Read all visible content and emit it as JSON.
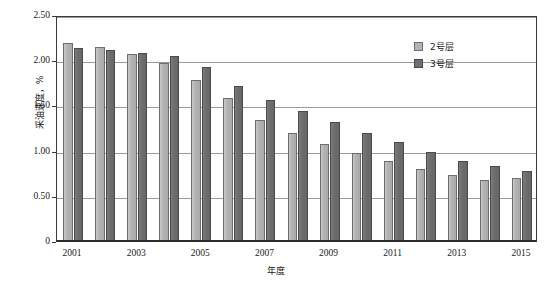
{
  "chart_data": {
    "type": "bar",
    "title": "",
    "subtitle": "",
    "xlabel": "年度",
    "ylabel": "采油速度，%",
    "categories": [
      "2001",
      "2002",
      "2003",
      "2004",
      "2005",
      "2006",
      "2007",
      "2008",
      "2009",
      "2010",
      "2011",
      "2012",
      "2013",
      "2014",
      "2015"
    ],
    "xtick_labels": [
      "2001",
      "2003",
      "2005",
      "2007",
      "2009",
      "2011",
      "2013",
      "2015"
    ],
    "xtick_categories": [
      "2001",
      "2003",
      "2005",
      "2007",
      "2009",
      "2011",
      "2013",
      "2015"
    ],
    "ytick_labels": [
      "0",
      "0.50",
      "1.00",
      "1.50",
      "2.00",
      "2.50"
    ],
    "ytick_values": [
      0,
      0.5,
      1.0,
      1.5,
      2.0,
      2.5
    ],
    "ylim": [
      0,
      2.5
    ],
    "grid": true,
    "legend_position": "top-right",
    "series": [
      {
        "name": "2号层",
        "color": "#b4b4b4",
        "values": [
          2.19,
          2.15,
          2.07,
          1.97,
          1.78,
          1.58,
          1.34,
          1.2,
          1.07,
          0.97,
          0.88,
          0.8,
          0.73,
          0.67,
          0.7
        ]
      },
      {
        "name": "3号层",
        "color": "#6e6e6e",
        "values": [
          2.14,
          2.11,
          2.08,
          2.05,
          1.93,
          1.72,
          1.56,
          1.44,
          1.32,
          1.2,
          1.09,
          0.98,
          0.89,
          0.83,
          0.77
        ]
      }
    ]
  },
  "legend": {
    "items": [
      {
        "label": "2号层"
      },
      {
        "label": "3号层"
      }
    ]
  },
  "axes": {
    "y_title": "采油速度，%",
    "x_title": "年度"
  }
}
